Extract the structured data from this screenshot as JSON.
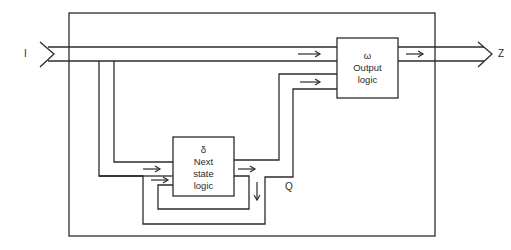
{
  "diagram": {
    "type": "sequential-machine-block-diagram",
    "colors": {
      "line": "#2b2b2b",
      "background": "#ffffff"
    },
    "signals": {
      "input": "I",
      "output": "Z",
      "state": "Q"
    },
    "blocks": [
      {
        "id": "next_state",
        "symbol": "δ",
        "label_line1": "Next",
        "label_line2": "state",
        "label_line3": "logic"
      },
      {
        "id": "output_logic",
        "symbol": "ω",
        "label_line1": "Output",
        "label_line2": "logic"
      }
    ],
    "edges": [
      {
        "from": "I",
        "to": "output_logic",
        "kind": "bus"
      },
      {
        "from": "I",
        "to": "next_state",
        "kind": "bus-branch"
      },
      {
        "from": "next_state",
        "to": "output_logic",
        "kind": "state-bus",
        "label": "Q"
      },
      {
        "from": "next_state",
        "to": "next_state",
        "kind": "feedback"
      },
      {
        "from": "output_logic",
        "to": "Z",
        "kind": "bus"
      }
    ]
  }
}
